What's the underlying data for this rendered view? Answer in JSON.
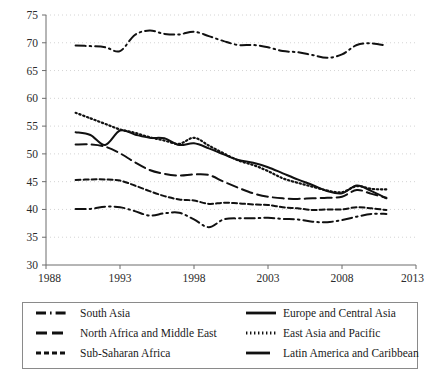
{
  "chart_data": {
    "type": "line",
    "title": "",
    "xlabel": "",
    "ylabel": "",
    "xlim": [
      1988,
      2013
    ],
    "ylim": [
      30,
      75
    ],
    "xticks": [
      1988,
      1993,
      1998,
      2003,
      2008,
      2013
    ],
    "yticks": [
      30,
      35,
      40,
      45,
      50,
      55,
      60,
      65,
      70,
      75
    ],
    "grid": "horizontal-dotted",
    "legend_position": "below-plot",
    "legend_columns": 2,
    "x": [
      1990,
      1991,
      1992,
      1993,
      1994,
      1995,
      1996,
      1997,
      1998,
      1999,
      2000,
      2001,
      2002,
      2003,
      2004,
      2005,
      2006,
      2007,
      2008,
      2009,
      2010,
      2011
    ],
    "series": [
      {
        "name": "South Asia",
        "style": "dash-dot",
        "values": [
          69.5,
          69.4,
          69.2,
          68.5,
          71.4,
          72.2,
          71.6,
          71.5,
          72.0,
          71.2,
          70.3,
          69.6,
          69.6,
          69.2,
          68.5,
          68.3,
          67.8,
          67.3,
          67.9,
          69.6,
          69.9,
          69.5
        ]
      },
      {
        "name": "Europe and Central Asia",
        "style": "solid",
        "values": [
          53.9,
          53.4,
          51.6,
          54.2,
          53.5,
          52.9,
          52.8,
          51.6,
          51.9,
          51.0,
          49.9,
          48.9,
          48.4,
          47.6,
          46.5,
          45.4,
          44.4,
          43.3,
          42.9,
          44.3,
          43.3,
          42.0
        ]
      },
      {
        "name": "North Africa and Middle East",
        "style": "long-dash",
        "values": [
          51.7,
          51.7,
          51.3,
          50.1,
          48.5,
          47.1,
          46.4,
          46.1,
          46.3,
          46.2,
          45.0,
          43.9,
          42.9,
          42.3,
          42.0,
          41.9,
          42.0,
          42.1,
          42.3,
          43.5,
          42.8,
          42.1
        ]
      },
      {
        "name": "East Asia and Pacific",
        "style": "dotted",
        "values": [
          57.4,
          56.4,
          55.4,
          54.4,
          53.8,
          53.0,
          52.4,
          51.8,
          52.9,
          51.5,
          50.1,
          48.8,
          48.0,
          46.9,
          45.6,
          44.8,
          44.1,
          43.4,
          43.1,
          44.2,
          43.7,
          43.6
        ]
      },
      {
        "name": "Sub-Saharan Africa",
        "style": "short-dash",
        "values": [
          45.3,
          45.4,
          45.4,
          45.2,
          44.3,
          43.3,
          42.4,
          41.8,
          41.6,
          41.0,
          41.2,
          41.1,
          40.9,
          40.8,
          40.4,
          40.2,
          39.9,
          40.0,
          40.0,
          40.4,
          40.2,
          39.9
        ]
      },
      {
        "name": "Latin America and Caribbean",
        "style": "dash-dot-mid",
        "values": [
          40.1,
          40.1,
          40.5,
          40.4,
          39.7,
          38.9,
          39.3,
          39.4,
          38.2,
          36.8,
          38.2,
          38.4,
          38.4,
          38.5,
          38.3,
          38.2,
          37.8,
          37.7,
          38.1,
          38.7,
          39.2,
          39.2
        ]
      }
    ]
  },
  "axes": {
    "y_tick_labels": [
      "75",
      "70",
      "65",
      "60",
      "55",
      "50",
      "45",
      "40",
      "35",
      "30"
    ],
    "x_tick_labels": [
      "1988",
      "1993",
      "1998",
      "2003",
      "2008",
      "2013"
    ]
  },
  "legend": {
    "entries": [
      {
        "label": "South Asia",
        "style": "dash-dot"
      },
      {
        "label": "Europe and Central Asia",
        "style": "solid"
      },
      {
        "label": "North Africa and Middle East",
        "style": "long-dash"
      },
      {
        "label": "East Asia and Pacific",
        "style": "dotted"
      },
      {
        "label": "Sub-Saharan Africa",
        "style": "short-dash"
      },
      {
        "label": "Latin America and Caribbean",
        "style": "solid-short"
      }
    ]
  },
  "colors": {
    "line": "#111111",
    "grid": "#cfcfcf",
    "axis": "#6d6d6d",
    "background": "#ffffff"
  }
}
